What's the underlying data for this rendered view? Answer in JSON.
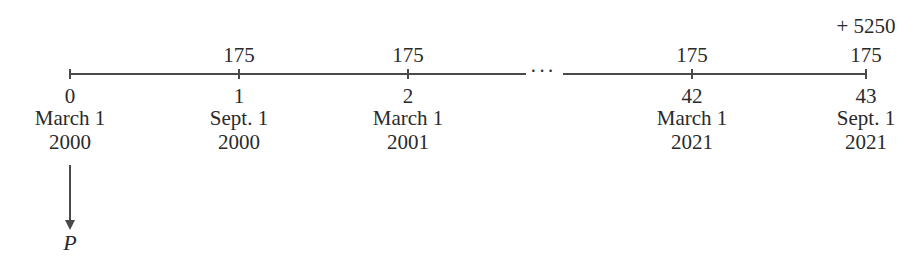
{
  "timeline": {
    "points": [
      {
        "x": 70,
        "period": "0",
        "date": "March 1",
        "year": "2000",
        "payment": "",
        "extra": ""
      },
      {
        "x": 239,
        "period": "1",
        "date": "Sept. 1",
        "year": "2000",
        "payment": "175",
        "extra": ""
      },
      {
        "x": 408,
        "period": "2",
        "date": "March 1",
        "year": "2001",
        "payment": "175",
        "extra": ""
      },
      {
        "x": 692,
        "period": "42",
        "date": "March 1",
        "year": "2021",
        "payment": "175",
        "extra": ""
      },
      {
        "x": 866,
        "period": "43",
        "date": "Sept. 1",
        "year": "2021",
        "payment": "175",
        "extra": "+ 5250"
      }
    ],
    "ellipsis": "···",
    "present_value_label": "P"
  }
}
